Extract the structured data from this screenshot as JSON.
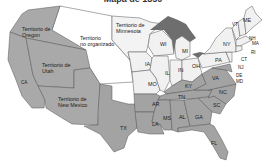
{
  "map": {
    "title": "Mapa de 1850",
    "colors": {
      "territory": "#a9a9a9",
      "unorganized": "#ffffff",
      "free_state": "#f1f1f1",
      "slave_state": "#a3a3a3",
      "lakes": "#6e6e6e",
      "border": "#555555"
    },
    "territories": {
      "oregon": [
        "Territorio de",
        "Oregon"
      ],
      "utah": [
        "Territorio de",
        "Utah"
      ],
      "new_mexico": [
        "Territorio de",
        "New Mexico"
      ],
      "minnesota": [
        "Territorio de",
        "Minnesota"
      ],
      "unorganized": [
        "Territorio",
        "no organizado"
      ]
    },
    "states": {
      "CA": "CA",
      "TX": "TX",
      "IA": "IA",
      "MO": "MO",
      "WI": "WI",
      "IL": "IL",
      "IN": "IN",
      "MI": "MI",
      "OH": "OH",
      "KY": "KY",
      "TN": "TN",
      "AR": "AR",
      "LA": "LA",
      "MS": "MS",
      "AL": "AL",
      "GA": "GA",
      "FL": "FL",
      "SC": "SC",
      "NC": "NC",
      "VA": "VA",
      "PA": "PA",
      "NY": "NY",
      "VT": "VT",
      "ME": "ME",
      "NH": "NH",
      "MA": "MA",
      "RI": "RI",
      "CT": "CT",
      "NJ": "NJ",
      "DE": "DE",
      "MD": "MD"
    }
  }
}
